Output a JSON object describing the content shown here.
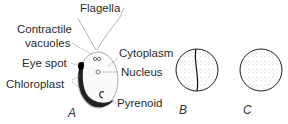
{
  "figure": {
    "labels": {
      "flagella": "Flagella",
      "contractile_1": "Contractile",
      "contractile_2": "vacuoles",
      "cytoplasm": "Cytoplasm",
      "eye_spot": "Eye spot",
      "nucleus": "Nucleus",
      "chloroplast": "Chloroplast",
      "pyrenoid": "Pyrenoid"
    },
    "panels": [
      {
        "id": "A",
        "caption": "A"
      },
      {
        "id": "B",
        "caption": "B"
      },
      {
        "id": "C",
        "caption": "C"
      }
    ]
  }
}
